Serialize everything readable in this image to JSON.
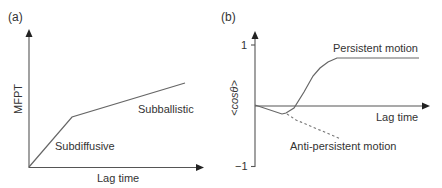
{
  "panels": {
    "a": {
      "tag": "(a)",
      "ylabel": "MFPT",
      "xlabel": "Lag time",
      "regions": {
        "early": "Subdiffusive",
        "late": "Subballistic"
      }
    },
    "b": {
      "tag": "(b)",
      "ylabel": "<cosθ>",
      "xlabel": "Lag time",
      "ticks": {
        "top": "1",
        "bottom": "−1"
      },
      "curves": {
        "persistent": "Persistent motion",
        "anti_persistent": "Anti-persistent motion"
      }
    }
  }
}
